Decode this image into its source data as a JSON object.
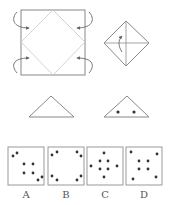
{
  "puzzle": {
    "step1": {
      "name": "square-with-diamond-fold",
      "arrows": 4
    },
    "step2": {
      "name": "folded-diamond-with-cross",
      "arrows": 1
    },
    "step3": {
      "name": "folded-triangle"
    },
    "step4": {
      "name": "triangle-with-holes",
      "holes": 2
    }
  },
  "colors": {
    "stroke": "#888888",
    "fold_line": "#bbbbbb",
    "dot": "#333333",
    "box_border": "#999999"
  },
  "options": [
    {
      "label": "A",
      "dots": [
        [
          5,
          9
        ],
        [
          9,
          6
        ],
        [
          16,
          17
        ],
        [
          25,
          17
        ],
        [
          16,
          26
        ],
        [
          25,
          26
        ],
        [
          30,
          33
        ],
        [
          34,
          30
        ]
      ]
    },
    {
      "label": "B",
      "dots": [
        [
          4,
          8
        ],
        [
          9,
          5
        ],
        [
          29,
          5
        ],
        [
          33,
          9
        ],
        [
          4,
          29
        ],
        [
          9,
          33
        ],
        [
          29,
          33
        ],
        [
          33,
          29
        ]
      ]
    },
    {
      "label": "C",
      "dots": [
        [
          17,
          6
        ],
        [
          4,
          19
        ],
        [
          13,
          14
        ],
        [
          21,
          14
        ],
        [
          30,
          19
        ],
        [
          13,
          22
        ],
        [
          21,
          22
        ],
        [
          17,
          30
        ]
      ]
    },
    {
      "label": "D",
      "dots": [
        [
          5,
          5
        ],
        [
          31,
          7
        ],
        [
          13,
          14
        ],
        [
          22,
          14
        ],
        [
          13,
          22
        ],
        [
          22,
          22
        ],
        [
          7,
          32
        ],
        [
          30,
          30
        ]
      ]
    }
  ]
}
